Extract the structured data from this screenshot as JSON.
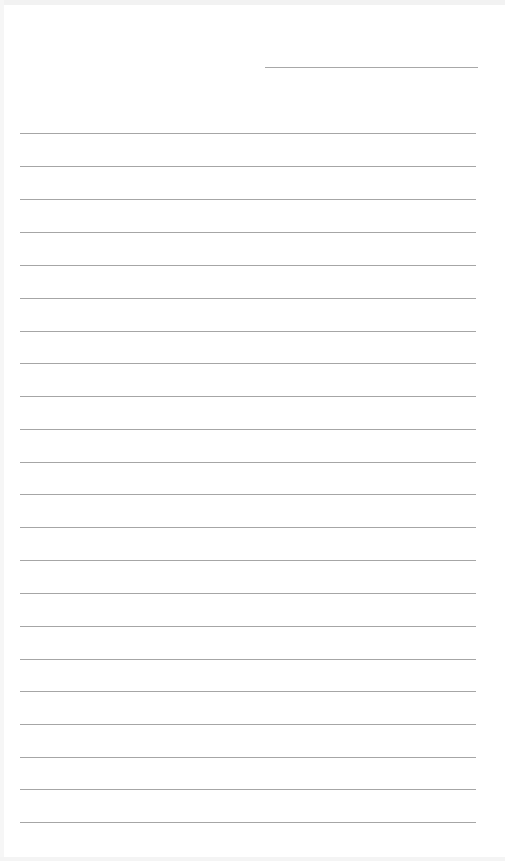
{
  "page": {
    "type": "lined-paper",
    "background_color": "#ffffff",
    "line_color": "#a6a6a6",
    "header_line": {
      "x": 265,
      "y": 67,
      "width": 213
    },
    "rules": {
      "count": 22,
      "x": 20,
      "width": 456,
      "y_positions": [
        133,
        166,
        199,
        232,
        265,
        298,
        331,
        363,
        396,
        429,
        462,
        494,
        527,
        560,
        593,
        626,
        659,
        691,
        724,
        757,
        789,
        822
      ]
    }
  }
}
